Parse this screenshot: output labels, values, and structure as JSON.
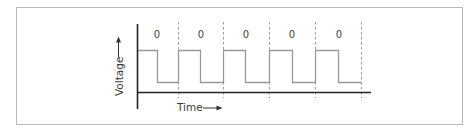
{
  "diagram": {
    "type": "square-wave-timing",
    "y_axis_label": "Voltage",
    "x_axis_label": "Time",
    "bit_labels": [
      "0",
      "0",
      "0",
      "0",
      "0"
    ],
    "colors": {
      "frame": "#b8b8b8",
      "axis": "#222222",
      "waveform": "#9a9a9a",
      "divider": "#9a9a9a",
      "text": "#3a3a3a"
    },
    "waveform": {
      "levels": [
        "high",
        "low"
      ],
      "periods": 5,
      "pattern_per_period": [
        "high",
        "low"
      ]
    }
  }
}
